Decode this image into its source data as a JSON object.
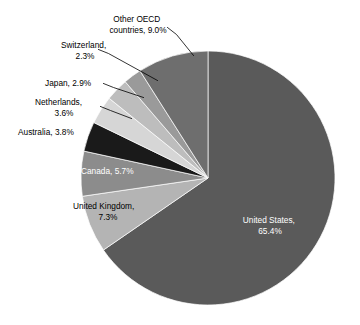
{
  "chart_data": {
    "type": "pie",
    "title": "",
    "subtitle": "",
    "xlabel": "",
    "ylabel": "",
    "legend_position": "none",
    "grid": false,
    "units": "percent",
    "start_angle_deg": 0,
    "direction": "clockwise",
    "categories": [
      "United States",
      "United Kingdom",
      "Canada",
      "Australia",
      "Netherlands",
      "Japan",
      "Switzerland",
      "Other OECD countries"
    ],
    "values": [
      65.4,
      7.3,
      5.7,
      3.8,
      3.6,
      2.9,
      2.3,
      9.0
    ],
    "colors": [
      "#5a5a5a",
      "#b4b4b4",
      "#8c8c8c",
      "#1a1a1a",
      "#d6d6d6",
      "#bdbdbd",
      "#9a9a9a",
      "#6e6e6e"
    ],
    "slices": [
      {
        "name": "United States",
        "value": 65.4,
        "color": "#5a5a5a",
        "label_line1": "United States,",
        "label_line2": "65.4%",
        "label_placement": "inside",
        "label_color": "#ffffff"
      },
      {
        "name": "United Kingdom",
        "value": 7.3,
        "color": "#b4b4b4",
        "label_line1": "United Kingdom,",
        "label_line2": "7.3%",
        "label_placement": "outside",
        "label_color": "#000000"
      },
      {
        "name": "Canada",
        "value": 5.7,
        "color": "#8c8c8c",
        "label_line1": "Canada, 5.7%",
        "label_line2": "",
        "label_placement": "inside",
        "label_color": "#ffffff"
      },
      {
        "name": "Australia",
        "value": 3.8,
        "color": "#1a1a1a",
        "label_line1": "Australia, 3.8%",
        "label_line2": "",
        "label_placement": "outside",
        "label_color": "#000000"
      },
      {
        "name": "Netherlands",
        "value": 3.6,
        "color": "#d6d6d6",
        "label_line1": "Netherlands,",
        "label_line2": "3.6%",
        "label_placement": "outside-leader",
        "label_color": "#000000"
      },
      {
        "name": "Japan",
        "value": 2.9,
        "color": "#bdbdbd",
        "label_line1": "Japan, 2.9%",
        "label_line2": "",
        "label_placement": "outside-leader",
        "label_color": "#000000"
      },
      {
        "name": "Switzerland",
        "value": 2.3,
        "color": "#9a9a9a",
        "label_line1": "Switzerland,",
        "label_line2": "2.3%",
        "label_placement": "outside-leader",
        "label_color": "#000000"
      },
      {
        "name": "Other OECD countries",
        "value": 9.0,
        "color": "#6e6e6e",
        "label_line1": "Other OECD",
        "label_line2": "countries, 9.0%",
        "label_placement": "outside-leader",
        "label_color": "#000000"
      }
    ]
  },
  "labels": {
    "united_states_l1": "United States,",
    "united_states_l2": "65.4%",
    "united_kingdom_l1": "United Kingdom,",
    "united_kingdom_l2": "7.3%",
    "canada": "Canada, 5.7%",
    "australia": "Australia, 3.8%",
    "netherlands_l1": "Netherlands,",
    "netherlands_l2": "3.6%",
    "japan": "Japan, 2.9%",
    "switzerland_l1": "Switzerland,",
    "switzerland_l2": "2.3%",
    "other_oecd_l1": "Other OECD",
    "other_oecd_l2": "countries, 9.0%"
  }
}
